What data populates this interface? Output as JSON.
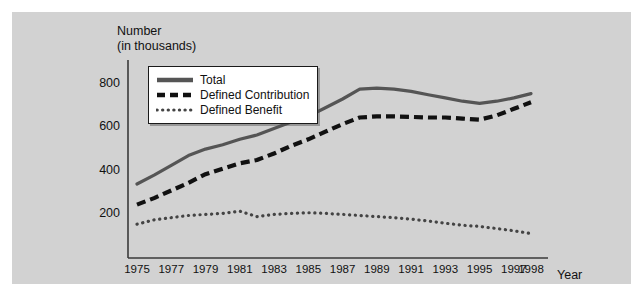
{
  "figure": {
    "background": "#d2d2d2",
    "page_background": "#ffffff",
    "ylabel_line1": "Number",
    "ylabel_line2": "(in thousands)",
    "xlabel": "Year"
  },
  "legend": {
    "position": "top-left-inside",
    "items": [
      {
        "label": "Total",
        "style": "solid",
        "color": "#555555"
      },
      {
        "label": "Defined Contribution",
        "style": "dashed",
        "color": "#111111"
      },
      {
        "label": "Defined Benefit",
        "style": "dotted",
        "color": "#444444"
      }
    ]
  },
  "chart_data": {
    "type": "line",
    "title": "",
    "xlabel": "Year",
    "ylabel": "Number (in thousands)",
    "xlim": [
      1975,
      1998
    ],
    "ylim": [
      0,
      900
    ],
    "yticks": [
      200,
      400,
      600,
      800
    ],
    "xticks": [
      1975,
      1977,
      1979,
      1981,
      1983,
      1985,
      1987,
      1989,
      1991,
      1993,
      1995,
      1997,
      1998
    ],
    "xtick_labels": [
      "1975",
      "1977",
      "1979",
      "1981",
      "1983",
      "1985",
      "1987",
      "1989",
      "1991",
      "1993",
      "1995",
      "1997",
      "1998"
    ],
    "grid": false,
    "legend_position": "upper left",
    "x": [
      1975,
      1976,
      1977,
      1978,
      1979,
      1980,
      1981,
      1982,
      1983,
      1984,
      1985,
      1986,
      1987,
      1988,
      1989,
      1990,
      1991,
      1992,
      1993,
      1994,
      1995,
      1996,
      1997,
      1998
    ],
    "series": [
      {
        "name": "Total",
        "style": "solid",
        "color": "#555555",
        "values": [
          340,
          380,
          425,
          470,
          500,
          520,
          545,
          565,
          595,
          625,
          650,
          690,
          730,
          775,
          780,
          775,
          765,
          750,
          735,
          720,
          710,
          720,
          735,
          755
        ]
      },
      {
        "name": "Defined Contribution",
        "style": "dashed",
        "color": "#111111",
        "values": [
          245,
          275,
          310,
          345,
          385,
          410,
          435,
          450,
          480,
          515,
          545,
          580,
          615,
          645,
          650,
          650,
          648,
          645,
          645,
          640,
          635,
          655,
          685,
          715
        ]
      },
      {
        "name": "Defined Benefit",
        "style": "dotted",
        "color": "#444444",
        "values": [
          155,
          175,
          185,
          195,
          200,
          205,
          215,
          190,
          200,
          205,
          208,
          205,
          200,
          195,
          190,
          185,
          178,
          170,
          160,
          150,
          145,
          135,
          125,
          112
        ]
      }
    ]
  }
}
